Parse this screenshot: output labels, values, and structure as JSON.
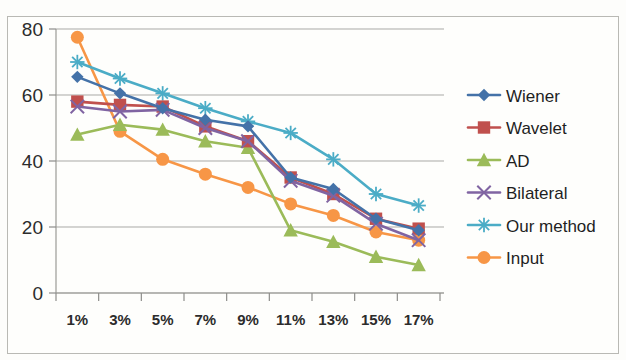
{
  "chart_data": {
    "type": "line",
    "title": "",
    "subtitle": "",
    "xlabel": "",
    "ylabel": "",
    "categories": [
      "1%",
      "3%",
      "5%",
      "7%",
      "9%",
      "11%",
      "13%",
      "15%",
      "17%"
    ],
    "xtick_labels": [
      "1%",
      "3%",
      "5%",
      "7%",
      "9%",
      "11%",
      "13%",
      "15%",
      "17%"
    ],
    "ytick_labels": [
      "0",
      "20",
      "40",
      "60",
      "80"
    ],
    "ytick_values": [
      0,
      20,
      40,
      60,
      80
    ],
    "ylim": [
      0,
      80
    ],
    "grid": true,
    "grid_axis": "y",
    "legend_position": "right",
    "series": [
      {
        "name": "Wiener",
        "color": "#4472a8",
        "marker": "diamond",
        "values": [
          65.5,
          60.5,
          56.0,
          52.5,
          50.5,
          35.0,
          31.5,
          22.5,
          19.0
        ]
      },
      {
        "name": "Wavelet",
        "color": "#c0504d",
        "marker": "square",
        "values": [
          58.0,
          57.0,
          56.5,
          50.5,
          46.0,
          35.0,
          30.0,
          22.5,
          19.5
        ]
      },
      {
        "name": "AD",
        "color": "#9bbb59",
        "marker": "triangle",
        "values": [
          48.0,
          51.0,
          49.5,
          46.0,
          44.0,
          19.0,
          15.5,
          11.0,
          8.5
        ]
      },
      {
        "name": "Bilateral",
        "color": "#8064a2",
        "marker": "cross",
        "values": [
          56.5,
          55.0,
          55.5,
          50.0,
          46.0,
          34.0,
          29.5,
          21.0,
          16.0
        ]
      },
      {
        "name": "Our method",
        "color": "#4bacc6",
        "marker": "asterisk",
        "values": [
          70.0,
          65.0,
          60.5,
          56.0,
          52.0,
          48.5,
          40.5,
          30.0,
          26.5
        ]
      },
      {
        "name": "Input",
        "color": "#f79646",
        "marker": "circle",
        "values": [
          77.5,
          49.0,
          40.5,
          36.0,
          32.0,
          27.0,
          23.5,
          18.5,
          16.0
        ]
      }
    ]
  },
  "legend": {
    "items": [
      {
        "label": "Wiener"
      },
      {
        "label": "Wavelet"
      },
      {
        "label": "AD"
      },
      {
        "label": "Bilateral"
      },
      {
        "label": "Our method"
      },
      {
        "label": "Input"
      }
    ]
  }
}
